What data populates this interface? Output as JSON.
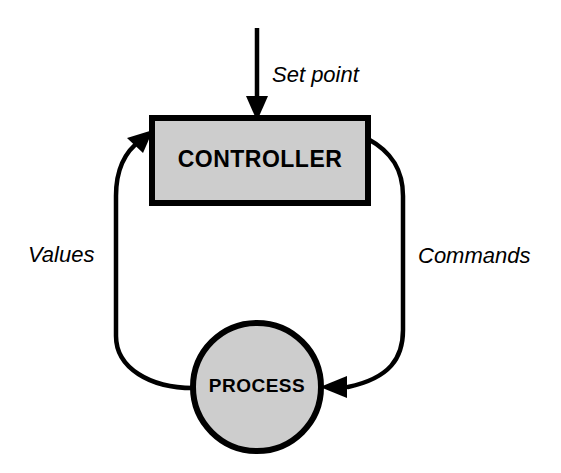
{
  "diagram": {
    "type": "block-diagram",
    "colors": {
      "stroke": "#000000",
      "fill": "#cdcdcd",
      "background": "#ffffff"
    },
    "nodes": [
      {
        "id": "controller",
        "label": "CONTROLLER",
        "shape": "rectangle",
        "x": 152,
        "y": 118,
        "width": 216,
        "height": 85
      },
      {
        "id": "process",
        "label": "PROCESS",
        "shape": "circle",
        "cx": 257,
        "cy": 387,
        "r": 64
      }
    ],
    "edges": [
      {
        "id": "set-point",
        "label": "Set point",
        "from": "external-input",
        "to": "controller",
        "direction": "down",
        "arrowhead": true
      },
      {
        "id": "commands",
        "label": "Commands",
        "from": "controller",
        "to": "process",
        "direction": "clockwise",
        "arrowhead": true
      },
      {
        "id": "values",
        "label": "Values",
        "from": "process",
        "to": "controller",
        "direction": "counter-clockwise",
        "arrowhead": true
      }
    ]
  }
}
